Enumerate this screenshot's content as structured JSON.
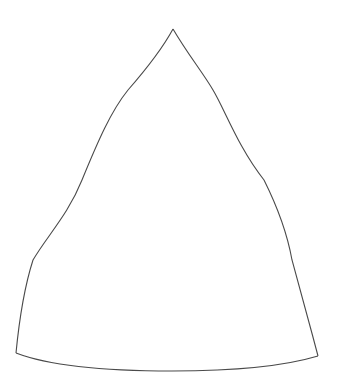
{
  "document": {
    "type": "line-drawing",
    "title": "Gore / cone segment outline template",
    "background_color": "#ffffff",
    "width": 339,
    "height": 388,
    "text_content": [],
    "has_labels": false,
    "has_axes": false,
    "has_fill": false
  },
  "figure": {
    "name": "gore-outline",
    "stroke_color": "#4a4a4a",
    "stroke_width": 1.1,
    "fill": "none",
    "geometry": {
      "apex": {
        "x": 173,
        "y": 29
      },
      "bottom_left_corner": {
        "x": 16,
        "y": 353
      },
      "bottom_right_corner": {
        "x": 318,
        "y": 356
      },
      "bottom_arc_lowest": {
        "x": 172,
        "y": 371
      },
      "left_edge_samples": [
        {
          "x": 173,
          "y": 29
        },
        {
          "x": 128,
          "y": 90
        },
        {
          "x": 113,
          "y": 120
        },
        {
          "x": 82,
          "y": 180
        },
        {
          "x": 33,
          "y": 260
        },
        {
          "x": 25,
          "y": 300
        },
        {
          "x": 16,
          "y": 353
        }
      ],
      "right_edge_samples": [
        {
          "x": 173,
          "y": 29
        },
        {
          "x": 213,
          "y": 90
        },
        {
          "x": 226,
          "y": 120
        },
        {
          "x": 264,
          "y": 180
        },
        {
          "x": 292,
          "y": 260
        },
        {
          "x": 302,
          "y": 300
        },
        {
          "x": 318,
          "y": 356
        }
      ],
      "bottom_edge_samples": [
        {
          "x": 16,
          "y": 353
        },
        {
          "x": 60,
          "y": 366
        },
        {
          "x": 100,
          "y": 369
        },
        {
          "x": 172,
          "y": 371
        },
        {
          "x": 240,
          "y": 368
        },
        {
          "x": 290,
          "y": 362
        },
        {
          "x": 318,
          "y": 356
        }
      ],
      "path_d": "M 173 29 C 163 47 146 69 128 90 C 110 112 97 143 82 180 C 66 217 47 238 33 260 C 26 283 20 320 16 353 C 55 366 110 371 172 371 C 234 371 285 365 318 356 C 312 320 305 281 302 300 C 297 270 294 266 292 260 C 283 230 272 206 264 180 C 252 148 239 114 226 120 C 216 104 190 57 173 29 Z"
    }
  }
}
